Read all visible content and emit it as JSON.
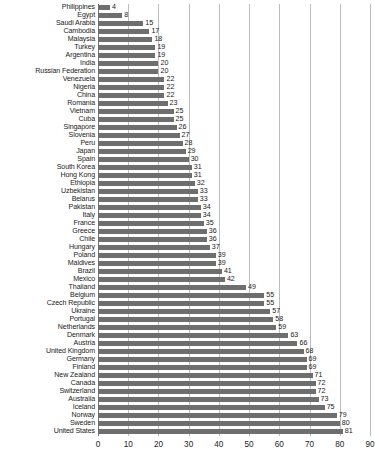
{
  "chart_data": {
    "type": "bar",
    "orientation": "horizontal",
    "title": "",
    "xlabel": "",
    "ylabel": "",
    "xlim": [
      0,
      90
    ],
    "xticks": [
      0,
      10,
      20,
      30,
      40,
      50,
      60,
      70,
      80,
      90
    ],
    "grid": true,
    "legend": null,
    "bar_color": "#6e6e6e",
    "gridline_color": "#b9bcc0",
    "categories": [
      "Philippines",
      "Egypt",
      "Saudi Arabia",
      "Cambodia",
      "Malaysia",
      "Turkey",
      "Argentina",
      "India",
      "Russian Federation",
      "Venezuela",
      "Nigeria",
      "China",
      "Romania",
      "Vietnam",
      "Cuba",
      "Singapore",
      "Slovenia",
      "Peru",
      "Japan",
      "Spain",
      "South Korea",
      "Hong Kong",
      "Ethiopia",
      "Uzbekistan",
      "Belarus",
      "Pakistan",
      "Italy",
      "France",
      "Greece",
      "Chile",
      "Hungary",
      "Poland",
      "Maldives",
      "Brazil",
      "Mexico",
      "Thailand",
      "Belgium",
      "Czech Republic",
      "Ukraine",
      "Portugal",
      "Netherlands",
      "Denmark",
      "Austria",
      "United Kingdom",
      "Germany",
      "Finland",
      "New Zealand",
      "Canada",
      "Switzerland",
      "Australia",
      "Iceland",
      "Norway",
      "Sweden",
      "United States"
    ],
    "values": [
      4,
      8,
      15,
      17,
      18,
      19,
      19,
      20,
      20,
      22,
      22,
      22,
      23,
      25,
      25,
      26,
      27,
      28,
      29,
      30,
      31,
      31,
      32,
      33,
      33,
      34,
      34,
      35,
      36,
      36,
      37,
      39,
      39,
      41,
      42,
      49,
      55,
      55,
      57,
      58,
      59,
      63,
      66,
      68,
      69,
      69,
      71,
      72,
      72,
      73,
      75,
      79,
      80,
      81
    ]
  }
}
